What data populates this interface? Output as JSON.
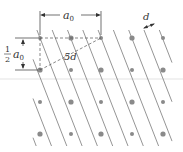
{
  "diagram": {
    "labels": {
      "a0": "a",
      "a0_sub": "0",
      "half_num": "1",
      "half_den": "2",
      "half_a0": "a",
      "half_a0_sub": "0",
      "five_d": "5d",
      "d": "d"
    },
    "colors": {
      "line": "#7a7a7a",
      "atom": "#8a8a8a",
      "dim": "#333333",
      "artifact": "#d8d8d8"
    },
    "lattice": {
      "columns_x": [
        40,
        71,
        101,
        132,
        163
      ],
      "rows_y": [
        38,
        70,
        102,
        134
      ],
      "a0_px": 61,
      "half_a0_px": 32
    },
    "plane_direction": {
      "dx": 0.39,
      "dy": 1
    },
    "plane_spacing_horizontal_px": 15.3
  }
}
